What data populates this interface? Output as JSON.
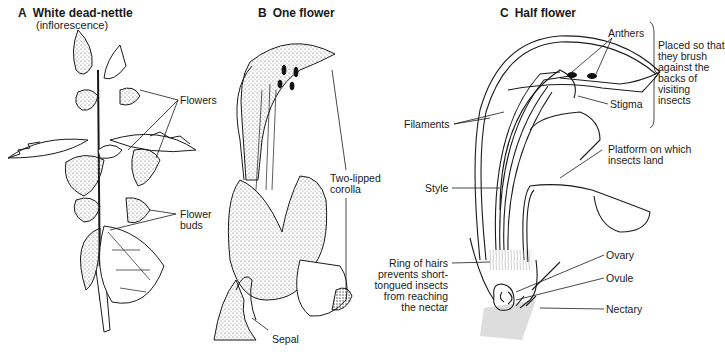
{
  "panels": [
    {
      "letter": "A",
      "title": "White dead-nettle",
      "subtitle": "(inflorescence)",
      "labels": {
        "flowers": "Flowers",
        "flower_buds": "Flower\nbuds"
      }
    },
    {
      "letter": "B",
      "title": "One flower",
      "labels": {
        "two_lipped_corolla": "Two-lipped\ncorolla",
        "sepal": "Sepal"
      }
    },
    {
      "letter": "C",
      "title": "Half flower",
      "labels": {
        "anthers": "Anthers",
        "anthers_note": "Placed so that\nthey brush\nagainst the\nbacks of\nvisiting\ninsects",
        "stigma": "Stigma",
        "filaments": "Filaments",
        "platform": "Platform on which\ninsects land",
        "style": "Style",
        "ring_of_hairs": "Ring of hairs\nprevents short-\ntongued insects\nfrom reaching\nthe nectar",
        "ovary": "Ovary",
        "ovule": "Ovule",
        "nectary": "Nectary"
      }
    }
  ],
  "colors": {
    "ink": "#1a1a1a",
    "background": "#ffffff",
    "stipple": "#9a9a9a"
  }
}
